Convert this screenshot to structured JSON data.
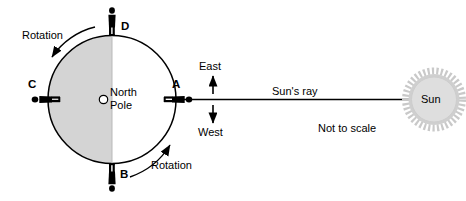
{
  "diagram": {
    "background_color": "#ffffff",
    "stroke_color": "#000000",
    "night_shade_color": "#d4d4d4",
    "sun_fill_color": "#d9d9d9",
    "sun_corona_color": "#c9c9c9"
  },
  "earth": {
    "pole_marker_name": "north-pole-marker",
    "pole_label_line1": "North",
    "pole_label_line2": "Pole",
    "night_side": "left",
    "day_side": "right"
  },
  "positions": [
    {
      "id": "A",
      "label": "A",
      "location": "right",
      "orientation": "horizontal-right"
    },
    {
      "id": "B",
      "label": "B",
      "location": "bottom",
      "orientation": "upside-down"
    },
    {
      "id": "C",
      "label": "C",
      "location": "left",
      "orientation": "horizontal-left"
    },
    {
      "id": "D",
      "label": "D",
      "location": "top",
      "orientation": "upright"
    }
  ],
  "rotation": {
    "top_left_label": "Rotation",
    "bottom_right_label": "Rotation",
    "direction": "counterclockwise"
  },
  "directions": {
    "up_label": "East",
    "down_label": "West"
  },
  "sun": {
    "label": "Sun",
    "ray_label": "Sun's ray",
    "scale_note": "Not to scale"
  }
}
